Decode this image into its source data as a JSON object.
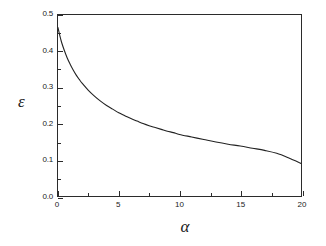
{
  "chart_data": {
    "type": "line",
    "title": "",
    "subtitle": "",
    "xlabel": "α",
    "ylabel": "ε",
    "xlim": [
      0,
      20
    ],
    "ylim": [
      0.0,
      0.5
    ],
    "grid": false,
    "legend": null,
    "x_ticks": [
      0,
      5,
      10,
      15,
      20
    ],
    "x_tick_labels": [
      "0",
      "5",
      "10",
      "15",
      "20"
    ],
    "x_minor_ticks": [
      2.5,
      7.5,
      12.5,
      17.5
    ],
    "y_ticks": [
      0.0,
      0.1,
      0.2,
      0.3,
      0.4,
      0.5
    ],
    "y_tick_labels": [
      "0.0",
      "0.1",
      "0.2",
      "0.3",
      "0.4",
      "0.5"
    ],
    "y_minor_ticks": [
      0.05,
      0.15,
      0.25,
      0.35,
      0.45
    ],
    "line_color": "#222222",
    "line_width": 1.1,
    "series": [
      {
        "name": "epsilon(alpha)",
        "x": [
          0,
          0.15,
          0.3,
          0.5,
          0.75,
          1,
          1.25,
          1.5,
          1.75,
          2,
          2.5,
          3,
          3.5,
          4,
          4.5,
          5,
          5.5,
          6,
          6.5,
          7,
          7.5,
          8,
          8.5,
          9,
          9.5,
          10,
          11,
          12,
          13,
          14,
          15,
          16,
          17,
          18,
          19,
          20
        ],
        "y": [
          0.465,
          0.443,
          0.424,
          0.404,
          0.382,
          0.364,
          0.348,
          0.334,
          0.322,
          0.311,
          0.292,
          0.276,
          0.262,
          0.25,
          0.24,
          0.23,
          0.222,
          0.214,
          0.207,
          0.2,
          0.194,
          0.189,
          0.184,
          0.179,
          0.175,
          0.17,
          0.163,
          0.156,
          0.149,
          0.143,
          0.138,
          0.132,
          0.126,
          0.118,
          0.105,
          0.09
        ]
      }
    ]
  },
  "axes": {
    "x_title": "α",
    "y_title": "ε"
  }
}
